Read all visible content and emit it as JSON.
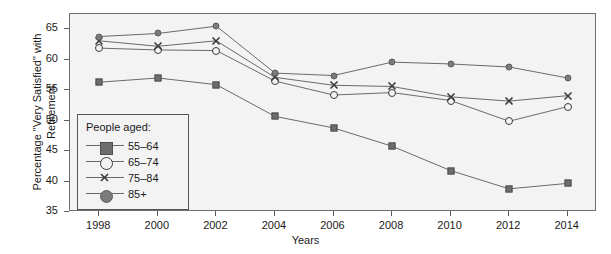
{
  "chart_data": {
    "type": "line",
    "title": "",
    "xlabel": "Years",
    "ylabel": "Percentage \"Very Satisfied\" with Retirement",
    "x": [
      1998,
      2000,
      2002,
      2004,
      2006,
      2008,
      2010,
      2012,
      2014
    ],
    "xtick_labels": [
      "1998",
      "2000",
      "2002",
      "2004",
      "2006",
      "2008",
      "2010",
      "2012",
      "2014"
    ],
    "ytick_labels": [
      "35",
      "40",
      "45",
      "50",
      "55",
      "60",
      "65"
    ],
    "yticks": [
      35,
      40,
      45,
      50,
      55,
      60,
      65
    ],
    "ylim": [
      35,
      67.5
    ],
    "xlim": [
      1997,
      2015
    ],
    "grid": false,
    "legend_position": "lower-left-inside",
    "legend_title": "People aged:",
    "series": [
      {
        "name": "55-64",
        "marker": "filled-square",
        "values": [
          56.3,
          57.0,
          55.9,
          50.7,
          48.8,
          45.8,
          41.8,
          38.8,
          39.7
        ]
      },
      {
        "name": "65-74",
        "marker": "open-circle",
        "values": [
          61.9,
          61.6,
          61.5,
          56.5,
          54.2,
          54.6,
          53.3,
          49.9,
          52.3
        ]
      },
      {
        "name": "75-84",
        "marker": "x-cross",
        "values": [
          63.1,
          62.2,
          63.1,
          57.1,
          55.8,
          55.6,
          53.9,
          53.2,
          54.1
        ]
      },
      {
        "name": "85+",
        "marker": "filled-circle",
        "values": [
          63.8,
          64.3,
          65.5,
          57.8,
          57.4,
          59.6,
          59.3,
          58.8,
          57.0
        ]
      }
    ],
    "colors": {
      "line": "#6a6a6a",
      "marker_fill": "#727272",
      "marker_edge": "#4f4f4f",
      "axis": "#6f6f6f",
      "plot_background": "#f3f3f3",
      "text": "#1a1a1a"
    }
  }
}
